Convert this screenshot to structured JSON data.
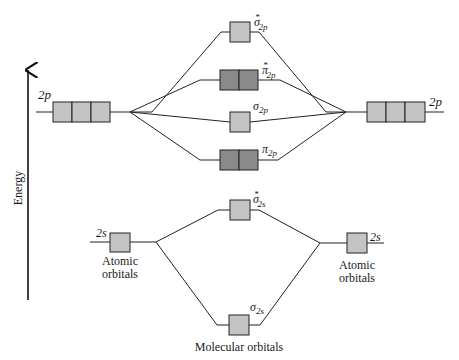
{
  "axis": {
    "label": "Energy"
  },
  "atomic_left": {
    "p_label": "2p",
    "s_label": "2s",
    "caption_line1": "Atomic",
    "caption_line2": "orbitals"
  },
  "atomic_right": {
    "p_label": "2p",
    "s_label": "2s",
    "caption_line1": "Atomic",
    "caption_line2": "orbitals"
  },
  "molecular": {
    "caption": "Molecular orbitals",
    "levels": [
      {
        "name": "sigma-star-2p",
        "symbol": "σ",
        "star": "*",
        "sub": "2p",
        "boxes": 1
      },
      {
        "name": "pi-star-2p",
        "symbol": "π",
        "star": "*",
        "sub": "2p",
        "boxes": 2
      },
      {
        "name": "sigma-2p",
        "symbol": "σ",
        "star": "",
        "sub": "2p",
        "boxes": 1
      },
      {
        "name": "pi-2p",
        "symbol": "π",
        "star": "",
        "sub": "2p",
        "boxes": 2
      },
      {
        "name": "sigma-star-2s",
        "symbol": "σ",
        "star": "*",
        "sub": "2s",
        "boxes": 1
      },
      {
        "name": "sigma-2s",
        "symbol": "σ",
        "star": "",
        "sub": "2s",
        "boxes": 1
      }
    ]
  },
  "colors": {
    "light_box": "#c4c4c4",
    "dark_box": "#8a8a8a",
    "line": "#222222"
  }
}
